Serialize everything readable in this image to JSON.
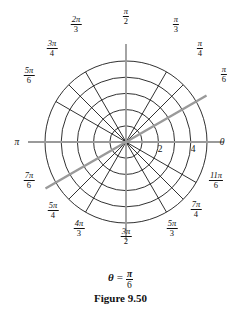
{
  "figure": {
    "caption": "Figure 9.50",
    "equation": {
      "variable": "θ",
      "equals": "=",
      "numerator": "π",
      "denominator": "6"
    }
  },
  "chart_data": {
    "type": "polar-grid",
    "title": "Figure 9.50",
    "annotation": "θ = π/6",
    "center_px": [
      126,
      142
    ],
    "max_radius_px": 81,
    "radial_ticks": [
      1,
      2,
      3,
      4,
      5
    ],
    "radial_tick_labels_shown": [
      "2",
      "4"
    ],
    "radial_label_positions_px": [
      [
        160,
        148
      ],
      [
        193,
        148
      ]
    ],
    "grid": true,
    "circle_count": 5,
    "ray_count": 12,
    "ray_step_deg": 30,
    "highlighted_line": {
      "label": "θ = π/6",
      "angle_deg": 30,
      "color": "#9a9a9a",
      "through_origin": true
    },
    "axes_color": "#9a9a9a",
    "grid_color": "#1a1a1a",
    "angle_labels": [
      {
        "name": "zero",
        "text_type": "plain",
        "text": "0",
        "angle_deg": 0,
        "x": 222,
        "y": 142
      },
      {
        "name": "pi-over-6",
        "text_type": "frac",
        "num": "π",
        "den": "6",
        "angle_deg": 30,
        "x": 224,
        "y": 74
      },
      {
        "name": "pi-over-3",
        "text_type": "frac",
        "num": "π",
        "den": "3",
        "angle_deg": 60,
        "x": 176,
        "y": 24
      },
      {
        "name": "pi-over-2",
        "text_type": "frac",
        "num": "π",
        "den": "2",
        "angle_deg": 90,
        "x": 126,
        "y": 16
      },
      {
        "name": "two-pi-over-3",
        "text_type": "frac",
        "num": "2π",
        "den": "3",
        "angle_deg": 120,
        "x": 76,
        "y": 24
      },
      {
        "name": "three-pi-over-4",
        "text_type": "frac",
        "num": "3π",
        "den": "4",
        "angle_deg": 135,
        "x": 52,
        "y": 48
      },
      {
        "name": "pi-over-4",
        "text_type": "frac",
        "num": "π",
        "den": "4",
        "angle_deg": 45,
        "x": 200,
        "y": 48
      },
      {
        "name": "five-pi-over-6",
        "text_type": "frac",
        "num": "5π",
        "den": "6",
        "angle_deg": 150,
        "x": 29,
        "y": 75
      },
      {
        "name": "pi",
        "text_type": "plain",
        "text": "π",
        "angle_deg": 180,
        "x": 17,
        "y": 142
      },
      {
        "name": "seven-pi-over-6",
        "text_type": "frac",
        "num": "7π",
        "den": "6",
        "angle_deg": 210,
        "x": 29,
        "y": 180
      },
      {
        "name": "five-pi-over-4",
        "text_type": "frac",
        "num": "5π",
        "den": "4",
        "angle_deg": 225,
        "x": 53,
        "y": 210
      },
      {
        "name": "four-pi-over-3",
        "text_type": "frac",
        "num": "4π",
        "den": "3",
        "angle_deg": 240,
        "x": 79,
        "y": 228
      },
      {
        "name": "three-pi-over-2",
        "text_type": "frac",
        "num": "3π",
        "den": "2",
        "angle_deg": 270,
        "x": 126,
        "y": 236
      },
      {
        "name": "five-pi-over-3",
        "text_type": "frac",
        "num": "5π",
        "den": "3",
        "angle_deg": 300,
        "x": 172,
        "y": 228
      },
      {
        "name": "seven-pi-over-4",
        "text_type": "frac",
        "num": "7π",
        "den": "4",
        "angle_deg": 315,
        "x": 196,
        "y": 209
      },
      {
        "name": "eleven-pi-over-6",
        "text_type": "frac",
        "num": "11π",
        "den": "6",
        "angle_deg": 330,
        "x": 216,
        "y": 180
      }
    ],
    "radius_labels": [
      {
        "name": "radius-label-2",
        "text": "2",
        "x": 160,
        "y": 149
      },
      {
        "name": "radius-label-4",
        "text": "4",
        "x": 193,
        "y": 149
      }
    ]
  }
}
